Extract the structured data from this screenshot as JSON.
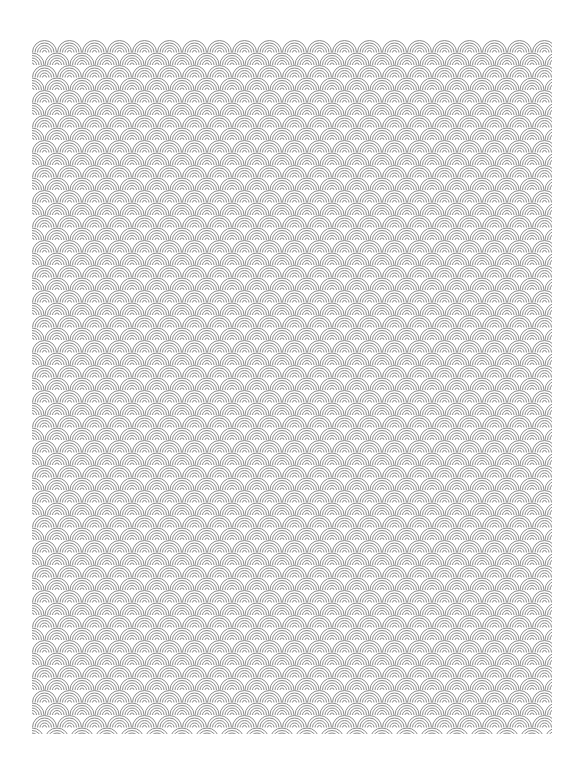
{
  "page": {
    "background_color": "#ffffff",
    "width": 583,
    "height": 769
  },
  "pattern": {
    "name": "seigaiha-wave-scales",
    "area": {
      "x": 32,
      "y": 40,
      "width": 520,
      "height": 694
    },
    "scale_width": 25,
    "row_height": 12.5,
    "arcs_per_scale": 5,
    "stroke_color": "#8a8a8a",
    "fill_color": "#ffffff",
    "stroke_width": 1
  }
}
